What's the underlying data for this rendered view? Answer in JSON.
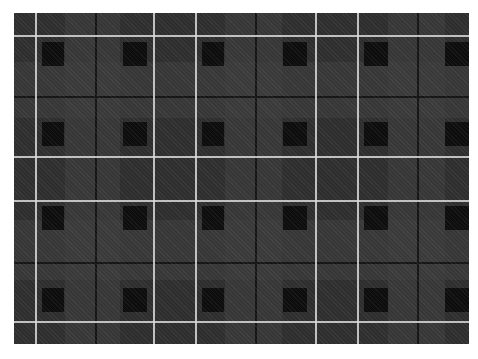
{
  "image": {
    "subject": "tartan plaid fabric",
    "colors": {
      "base": "#2e2e2e",
      "light_band": "#3c3c3c",
      "dark_block": "#0a0a0a",
      "thin_dark_line": "#151515",
      "white_line": "#d8d8d8"
    },
    "fabric_box": {
      "x": 14,
      "y": 13,
      "w": 455,
      "h": 331
    },
    "vertical_white_lines": [
      35,
      153,
      195,
      315,
      357
    ],
    "horizontal_white_lines": [
      35,
      156,
      200,
      321
    ],
    "vertical_light_bands": [
      [
        65,
        120
      ],
      [
        225,
        282
      ],
      [
        388,
        445
      ]
    ],
    "horizontal_light_bands": [
      [
        62,
        118
      ],
      [
        220,
        280
      ]
    ],
    "dark_blocks_cols": [
      [
        42,
        64
      ],
      [
        123,
        147
      ],
      [
        202,
        224
      ],
      [
        283,
        307
      ],
      [
        364,
        388
      ],
      [
        445,
        469
      ]
    ],
    "dark_blocks_rows": [
      [
        42,
        66
      ],
      [
        122,
        146
      ],
      [
        206,
        230
      ],
      [
        288,
        312
      ]
    ],
    "thin_dark_h_lines": [
      96,
      262
    ],
    "thin_dark_v_lines": [
      95,
      255,
      417
    ]
  }
}
